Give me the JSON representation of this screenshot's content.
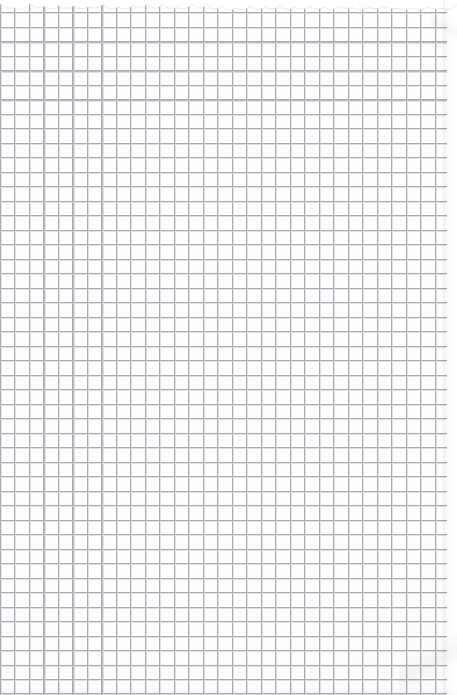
{
  "document": {
    "kind": "graph-paper-scan",
    "title": "Blank quadrille / graph paper sheet",
    "has_text": false,
    "has_handwriting": false,
    "has_ui_chrome": false,
    "text_content": ""
  },
  "canvas": {
    "width_px": 457,
    "height_px": 695,
    "background_color": "#ffffff"
  },
  "sheet": {
    "left_px": 0,
    "top_px": 0,
    "width_px": 447,
    "height_px": 695,
    "paper_color": "#fefefe",
    "description": "Scanned sheet of squared notebook paper occupying nearly the full frame, trimmed slightly short of the right edge."
  },
  "grid": {
    "type": "square-quadrille",
    "cell_size_px": 14.5,
    "line_width_px": 1,
    "line_color": "#a9acb2",
    "line_color_faint": "#c9ccd2",
    "offset_x_px": 0,
    "offset_y_px": -2,
    "approx_columns": 31,
    "approx_rows": 48,
    "has_major_gridlines": false,
    "has_margin_rule": false,
    "has_binding_holes": false
  },
  "artifacts": {
    "torn_top_edge": {
      "present": true,
      "height_px": 14,
      "tab_count": 31,
      "description": "Perforated tear-out edge along the top with small scalloped tabs."
    },
    "right_edge_shadow": {
      "present": true,
      "start_x_px": 443,
      "description": "Soft drop shadow where the paper edge meets the white scan background."
    },
    "top_right_fold": {
      "present": true,
      "description": "Faint diagonal crease shadow at the upper-right corner."
    },
    "bottom_right_fold": {
      "present": true,
      "description": "Faint diagonal edge shadow at the lower-right corner."
    },
    "scan_banding": {
      "present": true,
      "description": "Very subtle horizontal banding and uneven line density from scanning."
    }
  }
}
